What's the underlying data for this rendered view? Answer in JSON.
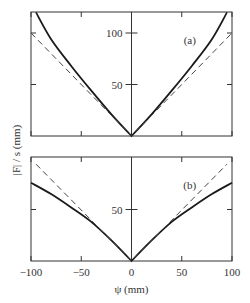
{
  "chart_data": [
    {
      "type": "line",
      "panel_label": "(a)",
      "xlim": [
        -100,
        100
      ],
      "ylim": [
        0,
        120
      ],
      "xticks": [
        -100,
        -50,
        0,
        50,
        100
      ],
      "yticks": [
        50,
        100
      ],
      "ytick_labels": [
        "50",
        "100"
      ],
      "series": [
        {
          "name": "solid",
          "style": "solid",
          "x": [
            -95,
            -80,
            -60,
            -40,
            -20,
            0,
            20,
            40,
            60,
            80,
            95
          ],
          "y": [
            120,
            94,
            68,
            44,
            21,
            0,
            21,
            44,
            68,
            94,
            120
          ]
        },
        {
          "name": "dashed",
          "style": "dashed",
          "x": [
            -100,
            0,
            100
          ],
          "y": [
            100,
            0,
            100
          ]
        }
      ]
    },
    {
      "type": "line",
      "panel_label": "(b)",
      "xlim": [
        -100,
        100
      ],
      "ylim": [
        0,
        100
      ],
      "xticks": [
        -100,
        -50,
        0,
        50,
        100
      ],
      "xtick_labels": [
        "−100",
        "−50",
        "0",
        "50",
        "100"
      ],
      "yticks": [
        50
      ],
      "ytick_labels": [
        "50"
      ],
      "xlabel": "ψ (mm)",
      "series": [
        {
          "name": "solid",
          "style": "solid",
          "x": [
            -100,
            -80,
            -60,
            -40,
            -20,
            0,
            20,
            40,
            60,
            80,
            100
          ],
          "y": [
            76,
            65,
            52,
            38,
            20,
            0,
            20,
            38,
            52,
            65,
            76
          ]
        },
        {
          "name": "dashed",
          "style": "dashed",
          "x": [
            -95,
            0,
            95
          ],
          "y": [
            94,
            0,
            94
          ]
        }
      ]
    }
  ],
  "shared_ylabel": "|F| / s (mm)"
}
